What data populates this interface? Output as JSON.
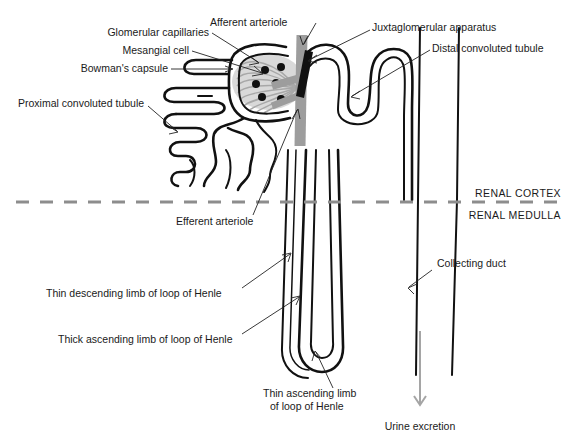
{
  "diagram": {
    "background_color": "#ffffff",
    "width": 577,
    "height": 447
  },
  "labels": {
    "glomerular_capillaries": "Glomerular capillaries",
    "mesangial_cell": "Mesangial cell",
    "bowmans_capsule": "Bowman's capsule",
    "proximal_convoluted_tubule": "Proximal convoluted tubule",
    "afferent_arteriole": "Afferent arteriole",
    "juxtaglomerular_apparatus": "Juxtaglomerular apparatus",
    "distal_convoluted_tubule": "Distal convoluted tubule",
    "renal_cortex": "RENAL CORTEX",
    "renal_medulla": "RENAL MEDULLA",
    "efferent_arteriole": "Efferent arteriole",
    "thin_descending_limb": "Thin descending limb of loop of Henle",
    "thick_ascending_limb": "Thick ascending limb of loop of Henle",
    "collecting_duct": "Collecting duct",
    "thin_ascending_limb_line1": "Thin ascending limb",
    "thin_ascending_limb_line2": "of loop of Henle",
    "urine_excretion": "Urine excretion"
  },
  "colors": {
    "tubule_outline": "#111111",
    "arteriole_gray": "#9d9d9d",
    "capillary_gray": "#a8a8a8",
    "mesangial_cell": "#111111",
    "jga_black": "#111111",
    "divider_gray": "#8d8d8d",
    "urine_arrow_gray": "#a5a5a5",
    "text": "#1a1a1a"
  },
  "structures": {
    "mesangial_cell_count": 6,
    "glomerular_capillary_loops": 10,
    "cortex_medulla_divider_y": 202
  }
}
